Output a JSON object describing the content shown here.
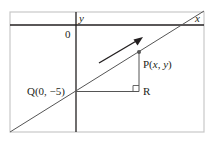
{
  "diagram": {
    "type": "coordinate-geometry",
    "axes": {
      "x_label": "x",
      "y_label": "y",
      "origin_label": "0"
    },
    "points": {
      "Q": {
        "label": "Q(0, −5)",
        "coords": [
          0,
          -5
        ]
      },
      "P": {
        "label": "P(x, y)"
      },
      "R": {
        "label": "R"
      }
    },
    "annotations": {
      "direction_arrow": "arrow-up-right",
      "right_angle_at": "R"
    },
    "colors": {
      "frame": "#c8c8c8",
      "axis": "#231f20",
      "line": "#555555",
      "triangle": "#555555",
      "text": "#231f20"
    }
  }
}
